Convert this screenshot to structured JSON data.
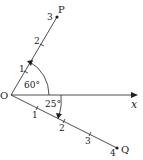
{
  "origin_label": "O",
  "x_axis_label": "x",
  "ray_p": {
    "label": "P",
    "angle": "60°",
    "ticks": [
      "1",
      "2",
      "3"
    ]
  },
  "ray_q": {
    "label": "Q",
    "angle": "25°",
    "ticks": [
      "1",
      "2",
      "3",
      "4"
    ]
  },
  "colors": {
    "line": "#222222",
    "background": "#ffffff"
  }
}
